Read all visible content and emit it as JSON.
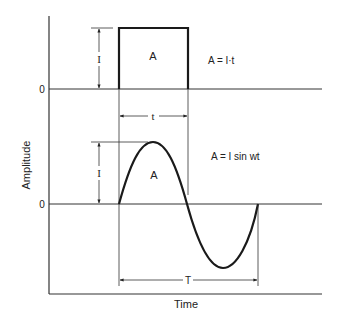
{
  "figure": {
    "ylabel": "Amplitude",
    "xlabel": "Time",
    "top_panel": {
      "zero_label": "0",
      "amplitude_label": "I",
      "area_label": "A",
      "equation": "A = I·t",
      "width_label": "t"
    },
    "bottom_panel": {
      "zero_label": "0",
      "amplitude_label": "I",
      "area_label": "A",
      "equation": "A = I sin wt",
      "period_label": "T"
    },
    "colors": {
      "line": "#1a1a1a",
      "axis": "#333333",
      "background": "#ffffff"
    }
  }
}
